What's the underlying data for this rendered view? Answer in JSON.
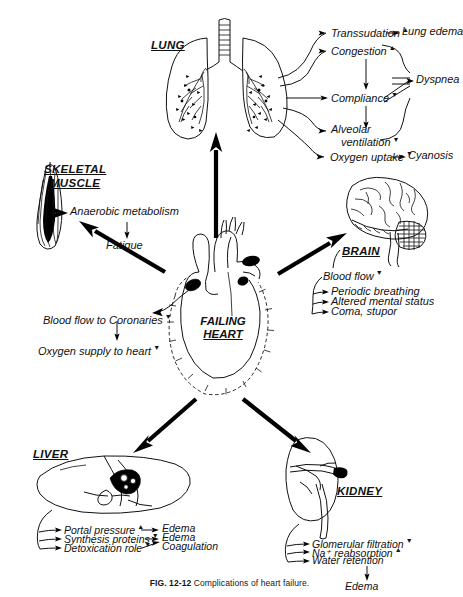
{
  "figure": {
    "caption_label": "FIG. 12-12",
    "caption_text": "Complications of heart failure.",
    "center": {
      "line1": "FAILING",
      "line2": "HEART",
      "name": "failing-heart"
    }
  },
  "organs": {
    "lung": {
      "label": "LUNG",
      "effects": [
        {
          "text": "Transsudation",
          "marker": "up-arrow"
        },
        {
          "text": "Congestion",
          "marker": "up-arrow"
        },
        {
          "text": "Compliance",
          "marker": "down-arrow"
        },
        {
          "text": "Alveolar",
          "text2": "ventilation",
          "marker": "down-arrow"
        },
        {
          "text": "Oxygen uptake",
          "marker": "down-arrow"
        }
      ],
      "outcomes": [
        {
          "text": "Lung edema"
        },
        {
          "text": "Dyspnea"
        },
        {
          "text": "Cyanosis"
        }
      ]
    },
    "skeletal_muscle": {
      "label_line1": "SKELETAL",
      "label_line2": "MUSCLE",
      "effects": [
        {
          "text": "Anaerobic metabolism"
        },
        {
          "text": "Fatigue"
        }
      ]
    },
    "brain": {
      "label": "BRAIN",
      "effects": [
        {
          "text": "Blood flow",
          "marker": "down-arrow"
        }
      ],
      "outcomes": [
        {
          "text": "Periodic breathing"
        },
        {
          "text": "Altered mental status"
        },
        {
          "text": "Coma, stupor"
        }
      ]
    },
    "coronary": {
      "effects": [
        {
          "text": "Blood flow to Coronaries",
          "marker": "down-arrow"
        },
        {
          "text": "Oxygen supply to heart",
          "marker": "down-arrow"
        }
      ]
    },
    "liver": {
      "label": "LIVER",
      "effects": [
        {
          "text": "Portal pressure",
          "marker": "up-arrow"
        },
        {
          "text": "Synthesis proteins",
          "marker": "down-arrow"
        },
        {
          "text": "Detoxication role",
          "marker": "down-arrow"
        }
      ],
      "outcomes": [
        {
          "text": "Edema"
        },
        {
          "text": "Edema"
        },
        {
          "text": "Coagulation"
        }
      ]
    },
    "kidney": {
      "label": "KIDNEY",
      "effects": [
        {
          "text": "Glomerular filtration",
          "marker": "down-arrow"
        },
        {
          "text": "Na⁺ reabsorption",
          "marker": "up-arrow"
        },
        {
          "text": "Water retention"
        }
      ],
      "outcomes": [
        {
          "text": "Edema"
        }
      ]
    }
  },
  "colors": {
    "ink": "#111111",
    "paper": "#ffffff"
  }
}
